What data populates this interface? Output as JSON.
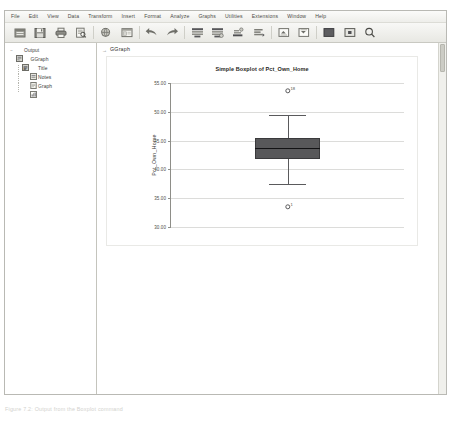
{
  "app": {
    "name": "IBM SPSS Statistics Viewer"
  },
  "menubar": {
    "items": [
      {
        "label": "File"
      },
      {
        "label": "Edit"
      },
      {
        "label": "View"
      },
      {
        "label": "Data"
      },
      {
        "label": "Transform"
      },
      {
        "label": "Insert"
      },
      {
        "label": "Format"
      },
      {
        "label": "Analyze"
      },
      {
        "label": "Graphs"
      },
      {
        "label": "Utilities"
      },
      {
        "label": "Extensions"
      },
      {
        "label": "Window"
      },
      {
        "label": "Help"
      }
    ]
  },
  "toolbar": {
    "buttons": [
      {
        "name": "open-file-icon",
        "tip": "Open data document"
      },
      {
        "name": "save-icon",
        "tip": "Save this document"
      },
      {
        "name": "print-icon",
        "tip": "Print"
      },
      {
        "name": "print-preview-icon",
        "tip": "Print preview"
      },
      {
        "name": "export-icon",
        "tip": "Export"
      },
      {
        "name": "recall-dialog-icon",
        "tip": "Recall recently used dialogs"
      },
      {
        "name": "undo-icon",
        "tip": "Undo"
      },
      {
        "name": "redo-icon",
        "tip": "Redo"
      },
      {
        "name": "go-to-data-icon",
        "tip": "Go to data"
      },
      {
        "name": "go-to-case-icon",
        "tip": "Go to case"
      },
      {
        "name": "variables-icon",
        "tip": "Variables"
      },
      {
        "name": "run-descriptives-icon",
        "tip": "Run descriptive statistics"
      },
      {
        "name": "promote-icon",
        "tip": "Promote"
      },
      {
        "name": "demote-icon",
        "tip": "Demote"
      },
      {
        "name": "collapse-icon",
        "tip": "Collapse"
      },
      {
        "name": "expand-icon",
        "tip": "Expand"
      },
      {
        "name": "find-icon",
        "tip": "Find"
      }
    ]
  },
  "outline": {
    "nodes": [
      {
        "label": "Output",
        "icon": "output-icon",
        "depth": 0,
        "twisty": "−"
      },
      {
        "label": "GGraph",
        "icon": "log-icon",
        "depth": 1,
        "twisty": "−"
      },
      {
        "label": "Title",
        "icon": "title-icon",
        "depth": 2,
        "twisty": ""
      },
      {
        "label": "Notes",
        "icon": "notes-icon",
        "depth": 2,
        "twisty": ""
      },
      {
        "label": "Graph",
        "icon": "graph-icon",
        "depth": 2,
        "twisty": ""
      }
    ]
  },
  "content": {
    "header_label": "GGraph",
    "header_marker": "→"
  },
  "caption": "Figure 7.2: Output from the Boxplot command",
  "sidemark": "",
  "chart_data": {
    "type": "box",
    "title": "Simple Boxplot of Pct_Own_Home",
    "xlabel": "",
    "ylabel": "Pct_Own_Home",
    "ylim": [
      30.0,
      56.0
    ],
    "grid": true,
    "legend": "none",
    "yticks": [
      "55.00",
      "50.00",
      "45.00",
      "40.00",
      "35.00",
      "30.00"
    ],
    "ytickvalues": [
      55.0,
      50.0,
      45.0,
      40.0,
      35.0,
      30.0
    ],
    "boxes": [
      {
        "category": "",
        "whisker_high": 50.3,
        "q3": 46.1,
        "median": 44.2,
        "q1": 42.3,
        "whisker_low": 37.7,
        "outliers": [
          {
            "value": 54.6,
            "label": "18",
            "position": "above"
          },
          {
            "value": 33.6,
            "label": "1",
            "position": "below"
          }
        ]
      }
    ]
  }
}
